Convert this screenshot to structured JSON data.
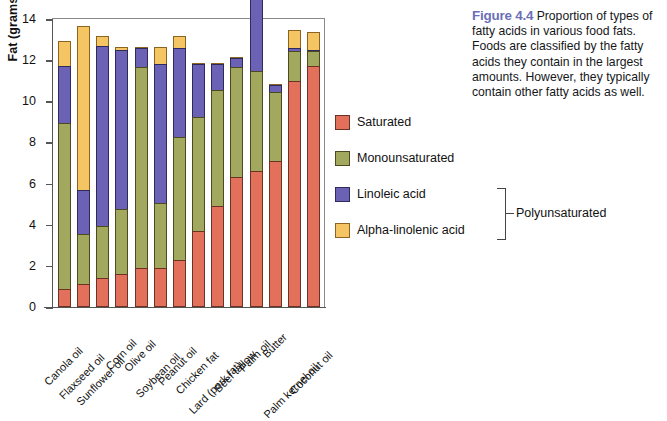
{
  "figure": {
    "caption_label": "Figure 4.4",
    "caption_text": " Proportion of types of fatty acids in various food fats. Foods are classified by the fatty acids they contain in the largest amounts. However, they typically contain other fatty acids as well.",
    "label_color": "#6b6fb8"
  },
  "legend": {
    "items": [
      {
        "label": "Saturated",
        "color": "#e2705a",
        "key": "sat"
      },
      {
        "label": "Monounsaturated",
        "color": "#a3a85f",
        "key": "mono"
      },
      {
        "label": "Linoleic acid",
        "color": "#6b62b5",
        "key": "lin"
      },
      {
        "label": "Alpha-linolenic acid",
        "color": "#f5c564",
        "key": "ala"
      }
    ],
    "bracket_label": "Polyunsaturated"
  },
  "chart_data": {
    "type": "bar",
    "stacked": true,
    "title": "",
    "xlabel": "",
    "ylabel": "Fat (grams)",
    "ylim": [
      0,
      14
    ],
    "yticks": [
      0,
      2,
      4,
      6,
      8,
      10,
      12,
      14
    ],
    "grid": false,
    "legend_position": "right",
    "categories": [
      "Canola oil",
      "Flaxseed oil",
      "Sunflower oil",
      "Corn oil",
      "Olive oil",
      "Soybean oil",
      "Peanut oil",
      "Chicken fat",
      "Lard (pork fat)",
      "Beef tallow",
      "Palm oil",
      "Butter",
      "Palm kernel oil",
      "Coconut oil"
    ],
    "series": [
      {
        "name": "Saturated",
        "color": "#e2705a",
        "values": [
          0.9,
          1.1,
          1.4,
          1.6,
          1.9,
          1.9,
          2.3,
          3.7,
          4.9,
          6.3,
          6.6,
          7.1,
          11.0,
          11.7
        ]
      },
      {
        "name": "Monounsaturated",
        "color": "#a3a85f",
        "values": [
          8.1,
          2.5,
          2.6,
          3.2,
          9.8,
          3.2,
          6.0,
          5.6,
          5.7,
          5.4,
          4.9,
          3.4,
          1.5,
          0.8
        ]
      },
      {
        "name": "Linoleic acid",
        "color": "#6b62b5",
        "values": [
          2.8,
          2.2,
          8.8,
          7.8,
          1.0,
          6.8,
          4.4,
          2.6,
          1.3,
          0.5,
          4.0,
          0.4,
          0.2,
          0.1
        ]
      },
      {
        "name": "Alpha-linolenic acid",
        "color": "#f5c564",
        "values": [
          1.3,
          8.0,
          0.5,
          0.2,
          0.1,
          0.9,
          0.6,
          0.1,
          0.1,
          0.1,
          0.9,
          0.1,
          0.9,
          0.9
        ]
      }
    ],
    "totals": [
      13.1,
      13.8,
      13.3,
      12.8,
      12.8,
      12.8,
      13.3,
      12.0,
      12.0,
      12.3,
      13.4,
      11.0,
      13.6,
      13.5
    ]
  }
}
